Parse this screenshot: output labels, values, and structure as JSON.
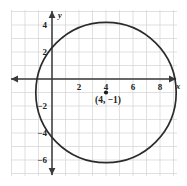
{
  "figure": {
    "background_color": "#ffffff",
    "grid_color": "#d2d2d6",
    "axis_color": "#3a3a3a",
    "curve_color": "#2b2b2b",
    "label_color": "#232323"
  },
  "axes": {
    "x_axis_name": "x",
    "y_axis_name": "y",
    "x_ticks": [
      {
        "label": "2",
        "value": 2
      },
      {
        "label": "4",
        "value": 4
      },
      {
        "label": "6",
        "value": 6
      },
      {
        "label": "8",
        "value": 8
      }
    ],
    "y_ticks": [
      {
        "label": "4",
        "value": 4
      },
      {
        "label": "2",
        "value": 2
      },
      {
        "label": "−2",
        "value": -2
      },
      {
        "label": "−4",
        "value": -4
      },
      {
        "label": "−6",
        "value": -6
      }
    ]
  },
  "chart_data": {
    "type": "scatter",
    "title": "",
    "subtitle": "",
    "xlabel": "x",
    "ylabel": "y",
    "xlim": [
      -3.1,
      9.3
    ],
    "ylim": [
      -7.1,
      5.2
    ],
    "grid": true,
    "grid_step": 1,
    "legend": "none",
    "annotations": [
      {
        "name": "center-point-label",
        "text": "(4, −1)",
        "x": 4,
        "y": -1
      }
    ],
    "series": [
      {
        "name": "circle",
        "shape": "circle",
        "center_x": 4,
        "center_y": -1,
        "radius": 5.2,
        "filled": false,
        "stroke_color": "#2b2b2b"
      },
      {
        "name": "center-point",
        "shape": "point",
        "x": [
          4
        ],
        "y": [
          -1
        ],
        "marker": "filled-dot",
        "color": "#1a1a1a"
      }
    ]
  }
}
